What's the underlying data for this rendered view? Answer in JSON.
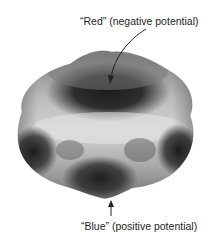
{
  "figure": {
    "labels": {
      "top": "“Red” (negative potential)",
      "bottom": "“Blue” (positive potential)"
    },
    "colors": {
      "background": "#ffffff",
      "surface_light": "#d8d8d8",
      "surface_dark": "#2a2a2a",
      "arrow": "#222222"
    }
  }
}
